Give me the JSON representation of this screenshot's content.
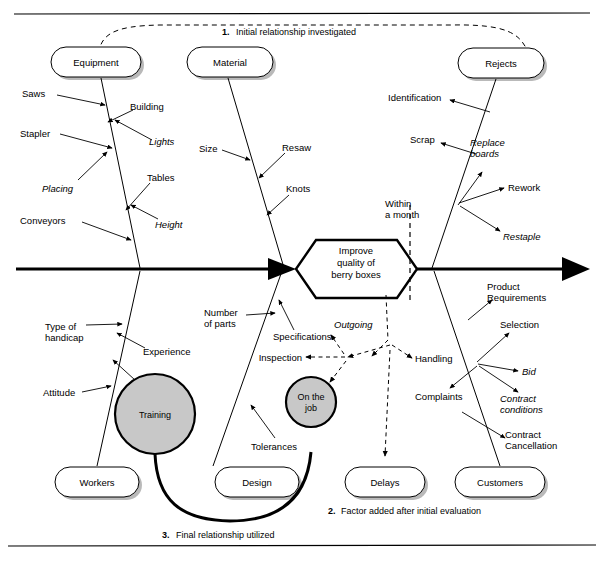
{
  "figure": {
    "type": "fishbone-ishikawa-cause-and-effect-diagram",
    "effect": {
      "line1": "Improve",
      "line2": "quality of",
      "line3": "berry boxes"
    },
    "timing_marker": {
      "line1": "Within",
      "line2": "a month"
    },
    "categories": {
      "top": [
        {
          "name": "equipment",
          "label": "Equipment"
        },
        {
          "name": "material",
          "label": "Material"
        },
        {
          "name": "rejects",
          "label": "Rejects"
        }
      ],
      "bottom": [
        {
          "name": "workers",
          "label": "Workers"
        },
        {
          "name": "design",
          "label": "Design"
        },
        {
          "name": "delays",
          "label": "Delays"
        },
        {
          "name": "customers",
          "label": "Customers"
        }
      ]
    },
    "causes": {
      "equipment": [
        {
          "label": "Saws",
          "italic": false
        },
        {
          "label": "Building",
          "italic": false
        },
        {
          "label": "Lights",
          "italic": true
        },
        {
          "label": "Stapler",
          "italic": false
        },
        {
          "label": "Placing",
          "italic": true
        },
        {
          "label": "Tables",
          "italic": false
        },
        {
          "label": "Height",
          "italic": true
        },
        {
          "label": "Conveyors",
          "italic": false
        }
      ],
      "material": [
        {
          "label": "Size",
          "italic": false
        },
        {
          "label": "Resaw",
          "italic": false
        },
        {
          "label": "Knots",
          "italic": false
        }
      ],
      "rejects": [
        {
          "label": "Identification",
          "italic": false
        },
        {
          "label": "Scrap",
          "italic": false
        },
        {
          "label": "Replace boards",
          "italic": true
        },
        {
          "label": "Rework",
          "italic": false
        },
        {
          "label": "Restaple",
          "italic": true
        }
      ],
      "workers": [
        {
          "label": "Type of handicap",
          "italic": false
        },
        {
          "label": "Experience",
          "italic": false
        },
        {
          "label": "Attitude",
          "italic": false
        },
        {
          "label": "Training",
          "italic": false,
          "shape": "circle"
        }
      ],
      "design": [
        {
          "label": "Number of parts",
          "italic": false
        },
        {
          "label": "Specifications",
          "italic": false
        },
        {
          "label": "Tolerances",
          "italic": false
        }
      ],
      "delays": [
        {
          "label": "Inspection",
          "italic": false
        },
        {
          "label": "Outgoing",
          "italic": true
        },
        {
          "label": "Handling",
          "italic": false
        },
        {
          "label": "On the job",
          "italic": false,
          "shape": "circle"
        }
      ],
      "customers": [
        {
          "label": "Product Requirements",
          "italic": false
        },
        {
          "label": "Selection",
          "italic": false
        },
        {
          "label": "Bid",
          "italic": true
        },
        {
          "label": "Complaints",
          "italic": false
        },
        {
          "label": "Contract conditions",
          "italic": true
        },
        {
          "label": "Contract Cancellation",
          "italic": false
        }
      ]
    },
    "labels": {
      "saws": "Saws",
      "building": "Building",
      "lights": "Lights",
      "stapler": "Stapler",
      "placing": "Placing",
      "tables": "Tables",
      "height": "Height",
      "conveyors": "Conveyors",
      "size": "Size",
      "resaw": "Resaw",
      "knots": "Knots",
      "identification": "Identification",
      "scrap": "Scrap",
      "replace_boards_1": "Replace",
      "replace_boards_2": "boards",
      "rework": "Rework",
      "restaple": "Restaple",
      "type_of_1": "Type of",
      "type_of_2": "handicap",
      "experience": "Experience",
      "attitude": "Attitude",
      "training": "Training",
      "number_of_1": "Number",
      "number_of_2": "of parts",
      "specifications": "Specifications",
      "tolerances": "Tolerances",
      "inspection": "Inspection",
      "outgoing": "Outgoing",
      "handling": "Handling",
      "onthejob_1": "On the",
      "onthejob_2": "job",
      "product_req_1": "Product",
      "product_req_2": "Requirements",
      "selection": "Selection",
      "bid": "Bid",
      "complaints": "Complaints",
      "contract_cond_1": "Contract",
      "contract_cond_2": "conditions",
      "contract_canc_1": "Contract",
      "contract_canc_2": "Cancellation"
    },
    "footnotes": [
      {
        "num": "1.",
        "text": "Initial relationship investigated"
      },
      {
        "num": "2.",
        "text": "Factor added after initial evaluation"
      },
      {
        "num": "3.",
        "text": "Final relationship utilized"
      }
    ],
    "colors": {
      "ink": "#000000",
      "paper": "#ffffff",
      "circle_fill": "#c8c8c8",
      "box_shadow": "#808080"
    }
  }
}
